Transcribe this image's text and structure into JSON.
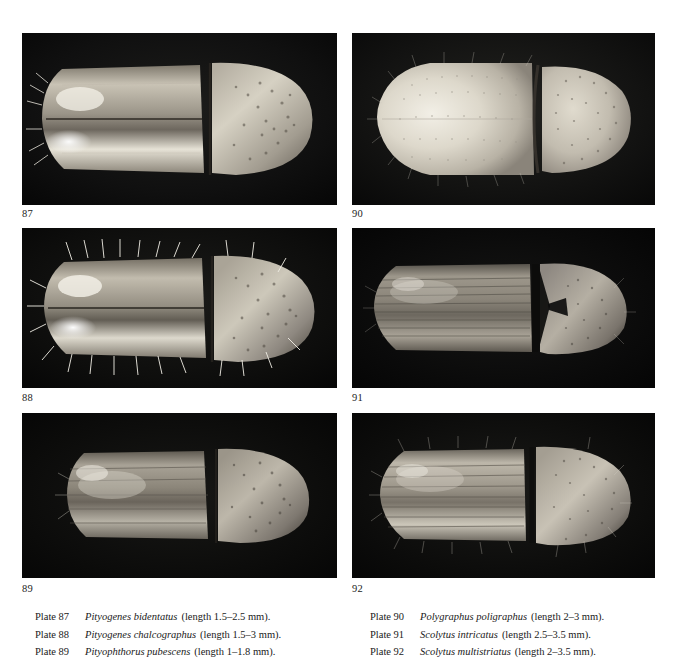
{
  "page": {
    "background_color": "#ffffff",
    "text_color": "#1a1a1a"
  },
  "figures": [
    {
      "number": "87",
      "column": "left",
      "row": 1,
      "specimen": "Pityogenes bidentatus",
      "background_color": "#0b0b0b",
      "body_color": "#d9d4c8"
    },
    {
      "number": "88",
      "column": "left",
      "row": 2,
      "specimen": "Pityogenes chalcographus",
      "background_color": "#0b0b0b",
      "body_color": "#cfc9bd"
    },
    {
      "number": "89",
      "column": "left",
      "row": 3,
      "specimen": "Pityophthorus pubescens",
      "background_color": "#090909",
      "body_color": "#b9b4ab"
    },
    {
      "number": "90",
      "column": "right",
      "row": 1,
      "specimen": "Polygraphus poligraphus",
      "background_color": "#101010",
      "body_color": "#e4e0d6"
    },
    {
      "number": "91",
      "column": "right",
      "row": 2,
      "specimen": "Scolytus intricatus",
      "background_color": "#080808",
      "body_color": "#aaa59c"
    },
    {
      "number": "92",
      "column": "right",
      "row": 3,
      "specimen": "Scolytus multistriatus",
      "background_color": "#0a0a0a",
      "body_color": "#c6c1b6"
    }
  ],
  "captions": {
    "left_column": [
      {
        "plate": "Plate 87",
        "species": "Pityogenes bidentatus",
        "length": "(length 1.5–2.5 mm)."
      },
      {
        "plate": "Plate 88",
        "species": "Pityogenes chalcographus",
        "length": "(length 1.5–3 mm)."
      },
      {
        "plate": "Plate 89",
        "species": "Pityophthorus pubescens",
        "length": "(length 1–1.8 mm)."
      }
    ],
    "right_column": [
      {
        "plate": "Plate 90",
        "species": "Polygraphus poligraphus",
        "length": "(length 2–3 mm)."
      },
      {
        "plate": "Plate 91",
        "species": "Scolytus intricatus",
        "length": "(length 2.5–3.5 mm)."
      },
      {
        "plate": "Plate 92",
        "species": "Scolytus multistriatus",
        "length": "(length 2–3.5 mm)."
      }
    ]
  }
}
